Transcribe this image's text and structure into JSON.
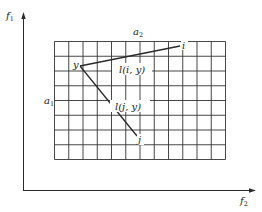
{
  "diagram": {
    "axes": {
      "y_label": "f",
      "y_label_sub": "1",
      "x_label": "f",
      "x_label_sub": "2"
    },
    "grid": {
      "columns": 12,
      "rows": 8,
      "top_label": "a",
      "top_label_sub": "2",
      "left_label": "a",
      "left_label_sub": "1"
    },
    "points": {
      "y": "y",
      "i": "i",
      "j": "j"
    },
    "edges": {
      "iy": "l(i, y)",
      "jy": "l(j, y)"
    },
    "colors": {
      "line": "#2a2a2a",
      "grid": "#333333",
      "background": "#ffffff"
    }
  }
}
